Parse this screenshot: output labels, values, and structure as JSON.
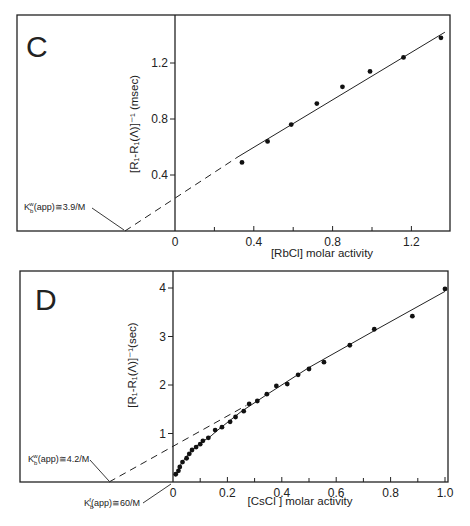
{
  "chart_data": [
    {
      "panel": "C",
      "type": "scatter",
      "title": "C",
      "xlabel": "[RbCl] molar activity",
      "ylabel": "[R1 - R1(Λ)]^-1 (msec)",
      "x_ticks": [
        0,
        0.4,
        0.8,
        1.2
      ],
      "x_tick_labels": [
        "0",
        "0.4",
        "0.8",
        "1.2"
      ],
      "y_ticks": [
        0.4,
        0.8,
        1.2
      ],
      "y_tick_labels": [
        "0.4",
        "0.8",
        "1.2"
      ],
      "xlim": [
        -0.8,
        1.4
      ],
      "ylim": [
        0,
        1.54
      ],
      "grid": false,
      "points": {
        "x": [
          0.34,
          0.47,
          0.59,
          0.72,
          0.85,
          0.99,
          1.16,
          1.35
        ],
        "y": [
          0.49,
          0.64,
          0.76,
          0.91,
          1.03,
          1.14,
          1.24,
          1.38
        ]
      },
      "fit_line": {
        "solid_from": [
          0.32,
          0.53
        ],
        "solid_to": [
          1.37,
          1.42
        ],
        "dashed_from": [
          -0.254,
          0.0
        ]
      },
      "annotations": [
        {
          "text": "K_b^w(app) ≅ 3.9/M",
          "x_intercept": -0.254
        }
      ]
    },
    {
      "panel": "D",
      "type": "scatter",
      "title": "D",
      "xlabel": "[CsCl ] molar activity",
      "ylabel": "[R1 - R1(Λ)]^-1 (sec)",
      "x_ticks": [
        0,
        0.2,
        0.4,
        0.6,
        0.8,
        1.0
      ],
      "x_tick_labels": [
        "0",
        "0.2",
        "0.4",
        "0.6",
        "0.8",
        "1.0"
      ],
      "y_ticks": [
        1,
        2,
        3,
        4
      ],
      "y_tick_labels": [
        "1",
        "2",
        "3",
        "4"
      ],
      "xlim": [
        -0.56,
        1.01
      ],
      "ylim": [
        0,
        4.36
      ],
      "grid": false,
      "points": {
        "x": [
          0.01,
          0.02,
          0.025,
          0.035,
          0.05,
          0.06,
          0.07,
          0.085,
          0.1,
          0.11,
          0.13,
          0.155,
          0.18,
          0.21,
          0.23,
          0.26,
          0.28,
          0.31,
          0.345,
          0.38,
          0.42,
          0.46,
          0.5,
          0.555,
          0.65,
          0.74,
          0.88,
          1.0
        ],
        "y": [
          0.16,
          0.23,
          0.31,
          0.41,
          0.49,
          0.58,
          0.66,
          0.72,
          0.78,
          0.85,
          0.91,
          1.07,
          1.13,
          1.24,
          1.34,
          1.46,
          1.61,
          1.67,
          1.81,
          1.98,
          2.02,
          2.21,
          2.33,
          2.47,
          2.82,
          3.15,
          3.42,
          3.98
        ]
      },
      "fit_curve": [
        [
          0.01,
          0.12
        ],
        [
          0.03,
          0.38
        ],
        [
          0.06,
          0.6
        ],
        [
          0.1,
          0.8
        ],
        [
          0.14,
          0.95
        ],
        [
          0.16,
          1.05
        ],
        [
          0.25,
          1.45
        ],
        [
          0.35,
          1.82
        ],
        [
          0.5,
          2.36
        ],
        [
          0.75,
          3.15
        ],
        [
          1.0,
          3.93
        ]
      ],
      "dashed_line": {
        "from": [
          -0.235,
          0.0
        ],
        "to": [
          0.27,
          1.58
        ]
      },
      "annotations": [
        {
          "text": "K_b^w(app) ≅ 4.2/M",
          "x_intercept": -0.235
        },
        {
          "text": "K_b^f(app) ≅ 60/M",
          "x_intercept": -0.017
        }
      ]
    }
  ],
  "panels": {
    "c": {
      "letter": "C",
      "xlabel": "[RbCl]  molar activity",
      "ylabel_main": "[R",
      "ylabel_full": "[R₁-R₁(Λ)]⁻¹ (msec)",
      "annotation": "K",
      "annotation_rest": "(app)≅3.9/M",
      "ann_sub": "b",
      "ann_sup": "w"
    },
    "d": {
      "letter": "D",
      "xlabel": "[CsCl ]  molar activity",
      "ylabel_full": "[R₁-R₁(Λ)]⁻¹(sec)",
      "annotation1_rest": "(app)≅4.2/M",
      "annotation1_sup": "w",
      "annotation2_rest": "(app)≅60/M",
      "annotation2_sup": "f",
      "ann_sub": "b",
      "ann_k": "K"
    }
  }
}
